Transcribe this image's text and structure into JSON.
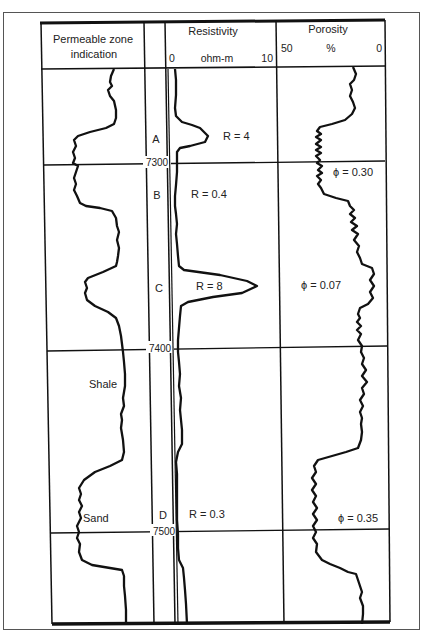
{
  "figure": {
    "type": "well-log",
    "tracks": [
      {
        "id": "permeable",
        "header": [
          "Permeable zone",
          "indication"
        ]
      },
      {
        "id": "depth",
        "header": []
      },
      {
        "id": "resistivity",
        "header": [
          "Resistivity"
        ],
        "scale": {
          "min": "0",
          "unit": "ohm-m",
          "max": "10"
        }
      },
      {
        "id": "porosity",
        "header": [
          "Porosity"
        ],
        "scale": {
          "min": "50",
          "unit": "%",
          "max": "0"
        }
      }
    ],
    "depth_markers": [
      "7300",
      "7400",
      "7500"
    ],
    "zones": [
      {
        "label": "A",
        "resistivity": "R = 4"
      },
      {
        "label": "B",
        "resistivity": "R = 0.4"
      },
      {
        "label": "C",
        "resistivity": "R = 8"
      },
      {
        "label": "D",
        "resistivity": "R = 0.3"
      }
    ],
    "porosity_labels": [
      "ϕ = 0.30",
      "ϕ = 0.07",
      "ϕ = 0.35"
    ],
    "lithology_labels": [
      "Shale",
      "Sand"
    ]
  },
  "colors": {
    "ink": "#1a1a1a",
    "frame": "#555555",
    "background": "#ffffff"
  }
}
